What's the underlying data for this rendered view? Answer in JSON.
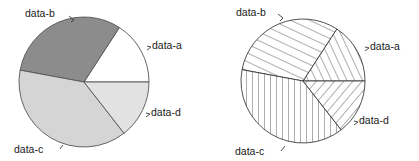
{
  "figure": {
    "width": 419,
    "height": 161,
    "background": "#ffffff"
  },
  "chart_data": [
    {
      "type": "pie",
      "title": "",
      "id": "pie-shaded",
      "labels": [
        "data-a",
        "data-b",
        "data-c",
        "data-d"
      ],
      "values": [
        57,
        112.5,
        138.5,
        52
      ],
      "value_unit": "degrees",
      "fractions": [
        0.158,
        0.313,
        0.385,
        0.144
      ],
      "start_angle_deg": 0,
      "direction": "counterclockwise",
      "center": {
        "x": 84,
        "y": 82
      },
      "radius": 65,
      "slice_fills": [
        "#ffffff",
        "#8c8c8c",
        "#d5d5d5",
        "#e2e2e2"
      ],
      "edge_color": "#555555",
      "legend": "none",
      "label_positions": [
        {
          "label": "data-a",
          "x": 152,
          "y": 49,
          "anchor": "start"
        },
        {
          "label": "data-b",
          "x": 25,
          "y": 17,
          "anchor": "start"
        },
        {
          "label": "data-c",
          "x": 14,
          "y": 153,
          "anchor": "start"
        },
        {
          "label": "data-d",
          "x": 151,
          "y": 116,
          "anchor": "start"
        }
      ]
    },
    {
      "type": "pie",
      "title": "",
      "id": "pie-hatched",
      "labels": [
        "data-a",
        "data-b",
        "data-c",
        "data-d"
      ],
      "values": [
        57,
        112.5,
        138.5,
        52
      ],
      "value_unit": "degrees",
      "fractions": [
        0.158,
        0.313,
        0.385,
        0.144
      ],
      "start_angle_deg": 0,
      "direction": "counterclockwise",
      "center": {
        "x": 303,
        "y": 81
      },
      "radius": 62,
      "slice_fills": [
        "hatch-diag-up-dense",
        "hatch-diag-up-steep",
        "hatch-vertical",
        "hatch-diag-down"
      ],
      "edge_color": "#333333",
      "legend": "none",
      "label_positions": [
        {
          "label": "data-a",
          "x": 370,
          "y": 50,
          "anchor": "start"
        },
        {
          "label": "data-b",
          "x": 236,
          "y": 16,
          "anchor": "start"
        },
        {
          "label": "data-c",
          "x": 235,
          "y": 155,
          "anchor": "start"
        },
        {
          "label": "data-d",
          "x": 359,
          "y": 124,
          "anchor": "start"
        }
      ]
    }
  ],
  "labels": {
    "a": "data-a",
    "b": "data-b",
    "c": "data-c",
    "d": "data-d"
  },
  "colors": {
    "slice_a": "#ffffff",
    "slice_b": "#8c8c8c",
    "slice_c": "#d5d5d5",
    "slice_d": "#e2e2e2",
    "outline": "#555555",
    "hatch": "#333333",
    "text": "#1a1a1a"
  }
}
